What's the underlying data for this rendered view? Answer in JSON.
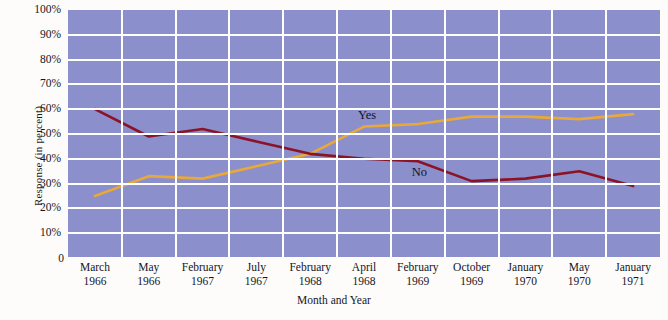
{
  "chart_data": {
    "type": "line",
    "title": "",
    "xlabel": "Month and Year",
    "ylabel": "Response (in percent)",
    "ylim": [
      0,
      100
    ],
    "grid": true,
    "legend_position": "inline-right",
    "categories": [
      "March\n1966",
      "May\n1966",
      "February\n1967",
      "July\n1967",
      "February\n1968",
      "April\n1968",
      "February\n1969",
      "October\n1969",
      "January\n1970",
      "May\n1970",
      "January\n1971"
    ],
    "x_tick_months": [
      "March",
      "May",
      "February",
      "July",
      "February",
      "April",
      "February",
      "October",
      "January",
      "May",
      "January"
    ],
    "x_tick_years": [
      "1966",
      "1966",
      "1967",
      "1967",
      "1968",
      "1968",
      "1969",
      "1969",
      "1970",
      "1970",
      "1971"
    ],
    "y_tick_labels": [
      "100%",
      "90%",
      "80%",
      "70%",
      "60%",
      "50%",
      "40%",
      "30%",
      "20%",
      "10%",
      "0"
    ],
    "y_tick_values": [
      100,
      90,
      80,
      70,
      60,
      50,
      40,
      30,
      20,
      10,
      0
    ],
    "series": [
      {
        "name": "Yes",
        "color": "#e8a83a",
        "values": [
          25,
          33,
          32,
          37,
          42,
          53,
          54,
          57,
          57,
          56,
          58
        ]
      },
      {
        "name": "No",
        "color": "#8c1326",
        "values": [
          60,
          49,
          52,
          47,
          42,
          40,
          39,
          31,
          32,
          35,
          29
        ]
      }
    ],
    "annotations": [
      {
        "text": "Yes",
        "series": "Yes",
        "at_category_index": 5
      },
      {
        "text": "No",
        "series": "No",
        "at_category_index": 6
      }
    ],
    "colors": {
      "plot_background": "#8b8fcc",
      "gridline": "#ffffff",
      "page_background": "#fdfcfa",
      "yes_line": "#e8a83a",
      "no_line": "#8c1326",
      "text": "#15151f"
    }
  }
}
